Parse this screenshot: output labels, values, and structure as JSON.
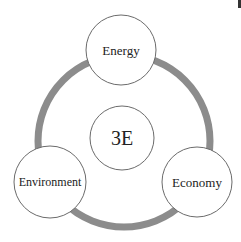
{
  "diagram": {
    "title": "3E",
    "center": {
      "label": "3E",
      "cx": 122,
      "cy": 138,
      "r": 32,
      "font_size": 20
    },
    "ring": {
      "cx": 124,
      "cy": 141,
      "r": 86,
      "stroke_width": 7,
      "color": "#8c8c8c"
    },
    "nodes": [
      {
        "id": "energy",
        "label": "Energy",
        "cx": 121,
        "cy": 50,
        "r": 35,
        "font_size": 13
      },
      {
        "id": "environment",
        "label": "Environment",
        "cx": 50,
        "cy": 182,
        "r": 36,
        "font_size": 12
      },
      {
        "id": "economy",
        "label": "Economy",
        "cx": 197,
        "cy": 182,
        "r": 35,
        "font_size": 13
      }
    ],
    "colors": {
      "circle_stroke": "#6b6b6b",
      "circle_fill": "#ffffff",
      "text": "#222222",
      "background": "#ffffff"
    }
  }
}
